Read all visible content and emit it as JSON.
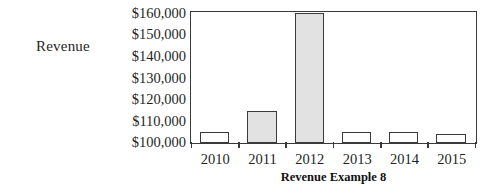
{
  "axis_caption": "Revenue",
  "chart_data": {
    "type": "bar",
    "title": "Revenue Example 8",
    "xlabel": "Revenue Example 8",
    "ylabel": "Revenue",
    "categories": [
      "2010",
      "2011",
      "2012",
      "2013",
      "2014",
      "2015"
    ],
    "values": [
      105000,
      115000,
      160000,
      105000,
      105000,
      104000
    ],
    "value_labels": [
      "$105,000",
      "$115,000",
      "$160,000",
      "$105,000",
      "$105,000",
      "$104,000"
    ],
    "bar_fills": [
      "#ffffff",
      "#e2e2e2",
      "#e2e2e2",
      "#ffffff",
      "#ffffff",
      "#ffffff"
    ],
    "bar_edge_color": "#3a3a3a",
    "ylim": [
      100000,
      160000
    ],
    "ytick_values": [
      160000,
      150000,
      140000,
      130000,
      120000,
      110000,
      100000
    ],
    "ytick_labels": [
      "$160,000",
      "$150,000",
      "$140,000",
      "$130,000",
      "$120,000",
      "$110,000",
      "$100,000"
    ],
    "grid": false,
    "legend": false,
    "baseline_value": 100000
  }
}
